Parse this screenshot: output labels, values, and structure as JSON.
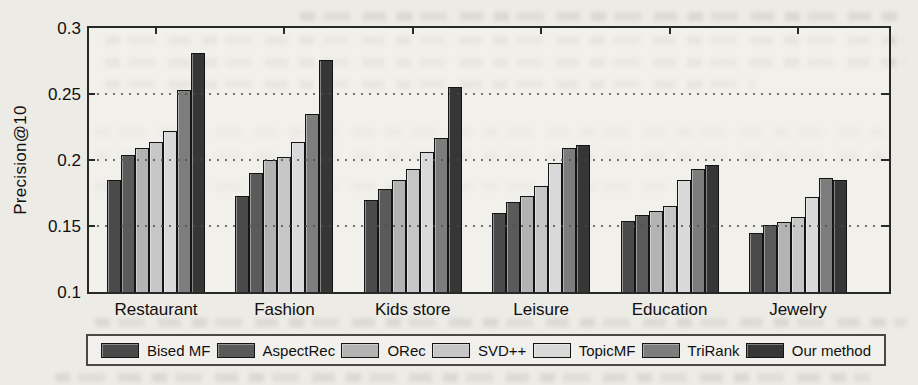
{
  "chart_data": {
    "type": "bar",
    "title": "",
    "ylabel": "Precision@10",
    "xlabel": "",
    "ylim": [
      0.1,
      0.3
    ],
    "yticks": [
      0.1,
      0.15,
      0.2,
      0.25,
      0.3
    ],
    "ytick_labels": [
      "0.1",
      "0.15",
      "0.2",
      "0.25",
      "0.3"
    ],
    "grid": "horizontal-dotted",
    "legend_position": "bottom",
    "categories": [
      "Restaurant",
      "Fashion",
      "Kids store",
      "Leisure",
      "Education",
      "Jewelry"
    ],
    "series": [
      {
        "name": "Bised MF",
        "color": "#4a4a4a",
        "values": [
          0.185,
          0.173,
          0.17,
          0.16,
          0.154,
          0.145
        ]
      },
      {
        "name": "AspectRec",
        "color": "#5a5a5a",
        "values": [
          0.204,
          0.19,
          0.178,
          0.168,
          0.158,
          0.151
        ]
      },
      {
        "name": "ORec",
        "color": "#b3b3b3",
        "values": [
          0.209,
          0.2,
          0.185,
          0.173,
          0.161,
          0.153
        ]
      },
      {
        "name": "SVD++",
        "color": "#c6c6c6",
        "values": [
          0.214,
          0.202,
          0.193,
          0.18,
          0.165,
          0.157
        ]
      },
      {
        "name": "TopicMF",
        "color": "#d9d9d9",
        "values": [
          0.222,
          0.214,
          0.206,
          0.198,
          0.185,
          0.172
        ]
      },
      {
        "name": "TriRank",
        "color": "#7d7d7d",
        "values": [
          0.253,
          0.235,
          0.217,
          0.209,
          0.193,
          0.186
        ]
      },
      {
        "name": "Our method",
        "color": "#363636",
        "values": [
          0.281,
          0.276,
          0.255,
          0.211,
          0.196,
          0.185
        ]
      }
    ]
  }
}
